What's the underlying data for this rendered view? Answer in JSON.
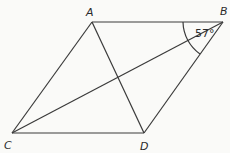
{
  "diagram": {
    "type": "parallelogram",
    "vertices": {
      "A": {
        "label": "A",
        "x": 92,
        "y": 22
      },
      "B": {
        "label": "B",
        "x": 223,
        "y": 22
      },
      "C": {
        "label": "C",
        "x": 12,
        "y": 133
      },
      "D": {
        "label": "D",
        "x": 144,
        "y": 133
      }
    },
    "sides": [
      "AB",
      "BD",
      "DC",
      "CA"
    ],
    "diagonals": [
      "AD",
      "BC"
    ],
    "angle_marking": {
      "vertex": "B",
      "between": [
        "BA",
        "BC"
      ],
      "label": "57°"
    },
    "line_color": "#3a3a3a"
  }
}
